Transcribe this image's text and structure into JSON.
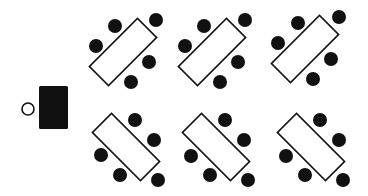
{
  "diagram": {
    "colors": {
      "background": "#ffffff",
      "ink": "#111111",
      "table_fill": "#ffffff"
    },
    "teacher": {
      "desk": {
        "x": 39,
        "y": 86,
        "w": 29,
        "h": 43
      },
      "chair": {
        "cx": 28,
        "cy": 109,
        "r": 6
      }
    },
    "table_template": {
      "length": 68,
      "width": 27,
      "chair_radius": 7
    },
    "groups": [
      {
        "id": "top-1",
        "cx": 123,
        "cy": 52,
        "angle": -45,
        "chairs": [
          [
            115,
            26
          ],
          [
            156,
            20
          ],
          [
            96,
            46
          ],
          [
            149,
            62
          ],
          [
            131,
            82
          ]
        ]
      },
      {
        "id": "top-2",
        "cx": 212,
        "cy": 52,
        "angle": -45,
        "chairs": [
          [
            204,
            26
          ],
          [
            245,
            20
          ],
          [
            185,
            46
          ],
          [
            238,
            62
          ],
          [
            220,
            82
          ]
        ]
      },
      {
        "id": "top-3",
        "cx": 305,
        "cy": 49,
        "angle": -45,
        "chairs": [
          [
            298,
            23
          ],
          [
            339,
            17
          ],
          [
            278,
            43
          ],
          [
            331,
            59
          ],
          [
            313,
            79
          ]
        ]
      },
      {
        "id": "bottom-1",
        "cx": 126,
        "cy": 147,
        "angle": 45,
        "chairs": [
          [
            135,
            120
          ],
          [
            154,
            140
          ],
          [
            101,
            155
          ],
          [
            120,
            175
          ],
          [
            158,
            180
          ]
        ]
      },
      {
        "id": "bottom-2",
        "cx": 216,
        "cy": 147,
        "angle": 45,
        "chairs": [
          [
            225,
            120
          ],
          [
            244,
            140
          ],
          [
            191,
            156
          ],
          [
            210,
            175
          ],
          [
            248,
            180
          ]
        ]
      },
      {
        "id": "bottom-3",
        "cx": 311,
        "cy": 147,
        "angle": 45,
        "chairs": [
          [
            320,
            120
          ],
          [
            339,
            140
          ],
          [
            286,
            156
          ],
          [
            305,
            175
          ],
          [
            343,
            180
          ]
        ]
      }
    ]
  }
}
